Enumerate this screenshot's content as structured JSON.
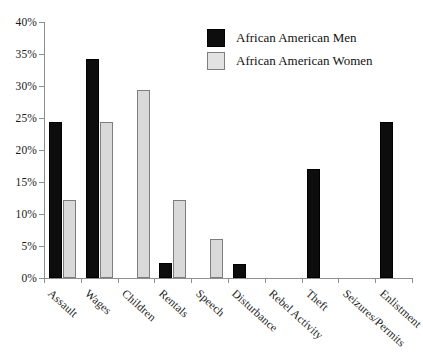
{
  "chart_data": {
    "type": "bar",
    "title": "",
    "subtitle": "",
    "xlabel": "",
    "ylabel": "",
    "ylim": [
      0,
      40
    ],
    "ytick_labels": [
      "0%",
      "5%",
      "10%",
      "15%",
      "20%",
      "25%",
      "30%",
      "35%",
      "40%"
    ],
    "ytick_values": [
      0,
      5,
      10,
      15,
      20,
      25,
      30,
      35,
      40
    ],
    "grid": false,
    "legend_position": "top-center-right",
    "categories": [
      "Assault",
      "Wages",
      "Children",
      "Rentals",
      "Speech",
      "Disturbance",
      "Rebel Activity",
      "Theft",
      "Seizures/Permits",
      "Enlistment"
    ],
    "series": [
      {
        "name": "African American Men",
        "color": "#0d0d0d",
        "values": [
          24.4,
          34.2,
          0,
          2.3,
          0,
          2.2,
          0,
          17.1,
          0,
          24.4
        ]
      },
      {
        "name": "African American Women",
        "color": "#d9d9d9",
        "values": [
          12.2,
          24.4,
          29.3,
          12.2,
          6.1,
          0,
          0,
          0,
          0,
          0
        ]
      }
    ]
  },
  "legend": {
    "items": [
      {
        "label": "African American Men",
        "swatch": "men"
      },
      {
        "label": "African American Women",
        "swatch": "women"
      }
    ]
  }
}
